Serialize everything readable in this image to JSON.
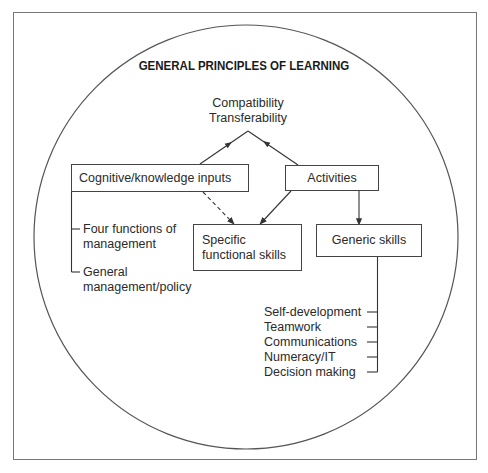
{
  "title": "GENERAL PRINCIPLES OF LEARNING",
  "outcomes": {
    "line1": "Compatibility",
    "line2": "Transferability"
  },
  "nodes": {
    "cognitive": {
      "label": "Cognitive/knowledge inputs"
    },
    "activities": {
      "label": "Activities"
    },
    "specific": {
      "line1": "Specific",
      "line2": "functional skills"
    },
    "generic": {
      "label": "Generic skills"
    }
  },
  "cognitive_branches": [
    {
      "line1": "Four functions of",
      "line2": "management"
    },
    {
      "line1": "General",
      "line2": "management/policy"
    }
  ],
  "generic_skills_list": [
    "Self-development",
    "Teamwork",
    "Communications",
    "Numeracy/IT",
    "Decision making"
  ],
  "edges": [
    {
      "from": "cognitive",
      "to": "outcomes",
      "style": "solid"
    },
    {
      "from": "activities",
      "to": "outcomes",
      "style": "solid"
    },
    {
      "from": "cognitive",
      "to": "specific",
      "style": "dashed"
    },
    {
      "from": "activities",
      "to": "specific",
      "style": "solid"
    },
    {
      "from": "activities",
      "to": "generic",
      "style": "solid"
    }
  ],
  "colors": {
    "stroke": "#444444",
    "frame": "#777777",
    "text": "#2a2a2a",
    "background": "#ffffff"
  }
}
